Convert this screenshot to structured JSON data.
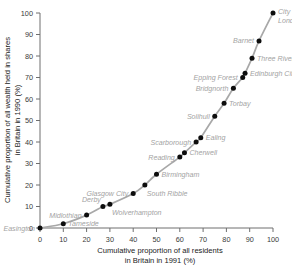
{
  "chart_data": {
    "type": "line",
    "title": "",
    "xlabel": "Cumulative proportion of all residents in Britain in 1991 (%)",
    "xlabel_line1": "Cumulative proportion of all residents",
    "xlabel_line2": "in Britain in 1991 (%)",
    "ylabel": "Cumulative proportion of all wealth held in shares in Britain in 1990 (%)",
    "ylabel_line1": "Cumulative proportion of all wealth held in shares",
    "ylabel_line2": "in Britain in 1990 (%)",
    "xlim": [
      0,
      100
    ],
    "ylim": [
      0,
      100
    ],
    "grid": false,
    "legend": "none",
    "xticks": [
      0,
      10,
      20,
      30,
      40,
      50,
      60,
      70,
      80,
      90,
      100
    ],
    "yticks": [
      0,
      10,
      20,
      30,
      40,
      50,
      60,
      70,
      80,
      90,
      100
    ],
    "xtick_labels": [
      "0",
      "10",
      "20",
      "30",
      "40",
      "50",
      "60",
      "70",
      "80",
      "90",
      "100"
    ],
    "ytick_labels": [
      "0",
      "10",
      "20",
      "30",
      "40",
      "50",
      "60",
      "70",
      "80",
      "90",
      "100"
    ],
    "series": [
      {
        "name": "Lorenz curve of share wealth",
        "x": [
          0,
          10,
          20,
          27,
          30,
          40,
          45,
          50,
          60,
          62,
          67,
          69,
          75,
          79,
          83,
          87,
          88,
          91,
          94,
          100
        ],
        "y": [
          0,
          2,
          6,
          10,
          11,
          16,
          20,
          25,
          33,
          35,
          40,
          42,
          52,
          58,
          65,
          70,
          72,
          79,
          87,
          100
        ],
        "point_labels": [
          "Easington",
          "Tameside",
          "Midlothian",
          "Derby",
          "Wolverhampton",
          "Glasgow City",
          "South Ribble",
          "Birmingham",
          "Reading",
          "Cherwell",
          "Scarborough",
          "Ealing",
          "Solihull",
          "Torbay",
          "Bridgnorth",
          "Epping Forest",
          "Edinburgh City",
          "Three Rivers",
          "Barnet",
          "City of London"
        ]
      }
    ],
    "annotations": [
      {
        "text": "Easington",
        "x": 0,
        "y": 0,
        "place": "left"
      },
      {
        "text": "Tameside",
        "x": 10,
        "y": 2,
        "place": "right"
      },
      {
        "text": "Midlothian",
        "x": 20,
        "y": 6,
        "place": "left"
      },
      {
        "text": "Derby",
        "x": 27,
        "y": 10,
        "place": "above-left"
      },
      {
        "text": "Wolverhampton",
        "x": 30,
        "y": 11,
        "place": "below-right"
      },
      {
        "text": "Glasgow City",
        "x": 40,
        "y": 16,
        "place": "left"
      },
      {
        "text": "South Ribble",
        "x": 45,
        "y": 20,
        "place": "below-right"
      },
      {
        "text": "Birmingham",
        "x": 50,
        "y": 25,
        "place": "right"
      },
      {
        "text": "Reading",
        "x": 60,
        "y": 33,
        "place": "left"
      },
      {
        "text": "Cherwell",
        "x": 62,
        "y": 35,
        "place": "right"
      },
      {
        "text": "Scarborough",
        "x": 67,
        "y": 40,
        "place": "left"
      },
      {
        "text": "Ealing",
        "x": 69,
        "y": 42,
        "place": "right"
      },
      {
        "text": "Solihull",
        "x": 75,
        "y": 52,
        "place": "left"
      },
      {
        "text": "Torbay",
        "x": 79,
        "y": 58,
        "place": "right"
      },
      {
        "text": "Bridgnorth",
        "x": 83,
        "y": 65,
        "place": "left"
      },
      {
        "text": "Epping Forest",
        "x": 87,
        "y": 70,
        "place": "left"
      },
      {
        "text": "Edinburgh City",
        "x": 88,
        "y": 72,
        "place": "right"
      },
      {
        "text": "Three Rivers",
        "x": 91,
        "y": 79,
        "place": "right"
      },
      {
        "text": "Barnet",
        "x": 94,
        "y": 87,
        "place": "left"
      },
      {
        "text": "City of London",
        "x": 100,
        "y": 100,
        "place": "right-two-line"
      },
      {
        "text": "City of",
        "x": 100,
        "y": 100,
        "place": "hidden"
      },
      {
        "text": "London",
        "x": 100,
        "y": 100,
        "place": "hidden"
      }
    ],
    "colors": {
      "curve": "#a8a8a8",
      "point": "#0d0d0d",
      "label": "#a3a3a3",
      "axis": "#6e6e6e",
      "tick_text": "#3a3a3a",
      "axis_title": "#1a1a1a",
      "background": "#ffffff"
    }
  }
}
